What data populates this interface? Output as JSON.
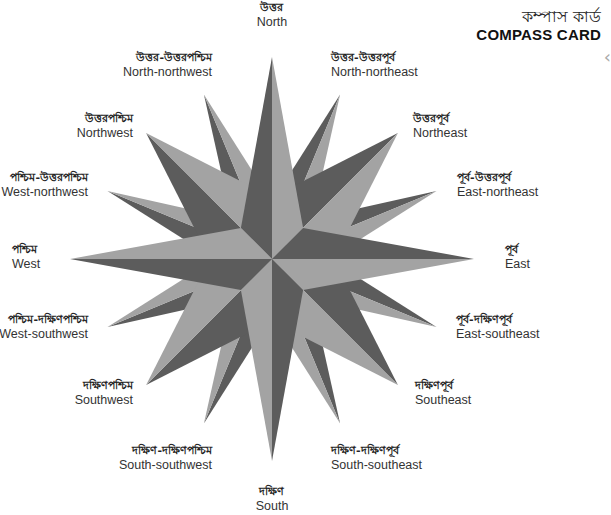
{
  "title": {
    "bengali": "কম্পাস কার্ড",
    "english": "COMPASS CARD"
  },
  "edge_arrow": "‹",
  "colors": {
    "light": "#a3a3a3",
    "dark": "#5c5c5c",
    "background": "#ffffff"
  },
  "directions": [
    {
      "key": "n",
      "bengali": "উত্তর",
      "english": "North"
    },
    {
      "key": "nne",
      "bengali": "উত্তর-উত্তরপূর্ব",
      "english": "North-northeast"
    },
    {
      "key": "ne",
      "bengali": "উত্তরপূর্ব",
      "english": "Northeast"
    },
    {
      "key": "ene",
      "bengali": "পূর্ব-উত্তরপূর্ব",
      "english": "East-northeast"
    },
    {
      "key": "e",
      "bengali": "পূর্ব",
      "english": "East"
    },
    {
      "key": "ese",
      "bengali": "পূর্ব-দক্ষিণপূর্ব",
      "english": "East-southeast"
    },
    {
      "key": "se",
      "bengali": "দক্ষিণপূর্ব",
      "english": "Southeast"
    },
    {
      "key": "sse",
      "bengali": "দক্ষিণ-দক্ষিণপূর্ব",
      "english": "South-southeast"
    },
    {
      "key": "s",
      "bengali": "দক্ষিণ",
      "english": "South"
    },
    {
      "key": "ssw",
      "bengali": "দক্ষিণ-দক্ষিণপশ্চিম",
      "english": "South-southwest"
    },
    {
      "key": "sw",
      "bengali": "দক্ষিণপশ্চিম",
      "english": "Southwest"
    },
    {
      "key": "wsw",
      "bengali": "পশ্চিম-দক্ষিণপশ্চিম",
      "english": "West-southwest"
    },
    {
      "key": "w",
      "bengali": "পশ্চিম",
      "english": "West"
    },
    {
      "key": "wnw",
      "bengali": "পশ্চিম-উত্তরপশ্চিম",
      "english": "West-northwest"
    },
    {
      "key": "nw",
      "bengali": "উত্তরপশ্চিম",
      "english": "Northwest"
    },
    {
      "key": "nnw",
      "bengali": "উত্তর-উত্তরপশ্চিম",
      "english": "North-northwest"
    }
  ]
}
